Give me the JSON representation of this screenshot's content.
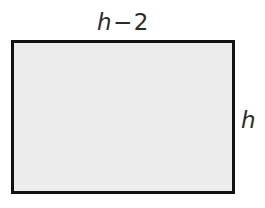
{
  "figure": {
    "type": "rectangle-diagram",
    "labels": {
      "width": {
        "full_text": "h − 2",
        "variable": "h",
        "operator": "−",
        "number": "2",
        "position": "top"
      },
      "height": {
        "full_text": "h",
        "variable": "h",
        "position": "right"
      }
    },
    "shape": {
      "name": "rectangle",
      "fill_color": "#ececec",
      "stroke_color": "#121212",
      "stroke_width_px": 3,
      "left_px": 11,
      "top_px": 40,
      "width_px": 224,
      "height_px": 154
    },
    "canvas": {
      "background_color": "#ffffff",
      "width_px": 265,
      "height_px": 208
    }
  }
}
